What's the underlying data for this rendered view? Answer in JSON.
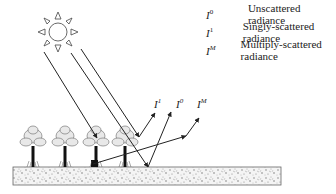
{
  "diagram": {
    "type": "radiative-transfer-schematic",
    "legend": [
      {
        "symbol": "I",
        "superscript": "0",
        "label": "Unscattered radiance"
      },
      {
        "symbol": "I",
        "superscript": "1",
        "label": "Singly-scattered radiance"
      },
      {
        "symbol": "I",
        "superscript": "M",
        "label": "Multiply-scattered radiance"
      }
    ],
    "ray_labels": [
      {
        "symbol": "I",
        "superscript": "1"
      },
      {
        "symbol": "I",
        "superscript": "0"
      },
      {
        "symbol": "I",
        "superscript": "M"
      }
    ],
    "elements": {
      "sun": "sun-icon",
      "trees": 4,
      "ground": "soil-surface",
      "incoming_rays": 3
    },
    "colors": {
      "line": "#222222",
      "background": "#ffffff",
      "soil": "#bbbbbb"
    }
  }
}
